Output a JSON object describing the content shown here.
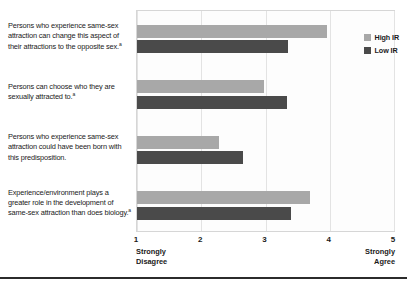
{
  "chart_data": {
    "type": "bar",
    "orientation": "horizontal",
    "title": "",
    "xlabel": "",
    "ylabel": "",
    "xlim": [
      1,
      5
    ],
    "xticks": [
      1,
      2,
      3,
      4,
      5
    ],
    "xtick_labels": [
      "1",
      "2",
      "3",
      "4",
      "5"
    ],
    "scale_anchor_low": "Strongly\nDisagree",
    "scale_anchor_high": "Strongly\nAgree",
    "grid": true,
    "legend_position": "top-right-inside",
    "categories": [
      "Persons who experience same-sex attraction can change this aspect of their attractions to the opposite sex.",
      "Persons can choose who they are sexually attracted to.",
      "Persons who experience same-sex attraction could have been born with this predisposition.",
      "Experience/environment plays a greater role in the development of same-sex attraction than does biology."
    ],
    "category_footnotes": [
      "a",
      "a",
      "",
      "a"
    ],
    "series": [
      {
        "name": "High IR",
        "color": "#a8a8a8",
        "values": [
          3.95,
          2.97,
          2.27,
          3.7
        ]
      },
      {
        "name": "Low IR",
        "color": "#4a4a4a",
        "values": [
          3.35,
          3.33,
          2.65,
          3.4
        ]
      }
    ]
  }
}
